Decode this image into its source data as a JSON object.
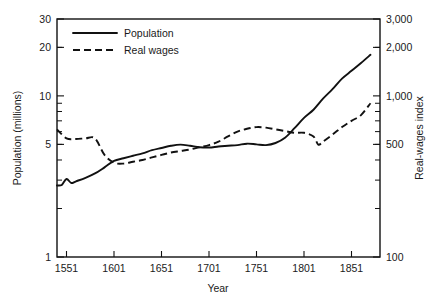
{
  "chart_data": {
    "type": "line",
    "title": "",
    "xlabel": "Year",
    "ylabel": "Population (millions)",
    "y2label": "Real-wages index",
    "xlim": [
      1541,
      1881
    ],
    "xticks": [
      1551,
      1601,
      1651,
      1701,
      1751,
      1801,
      1851
    ],
    "xticklabels": [
      "1551",
      "1601",
      "1651",
      "1701",
      "1751",
      "1801",
      "1851"
    ],
    "yscale": "log",
    "ylim": [
      1,
      30
    ],
    "yticks": [
      1,
      5,
      10,
      20,
      30
    ],
    "yticklabels": [
      "1",
      "5",
      "10",
      "20",
      "30"
    ],
    "y2scale": "log",
    "y2lim": [
      100,
      3000
    ],
    "y2ticks": [
      100,
      500,
      1000,
      2000,
      3000
    ],
    "y2ticklabels": [
      "100",
      "500",
      "1,000",
      "2,000",
      "3,000"
    ],
    "grid": false,
    "legend_position": "upper-left",
    "series": [
      {
        "name": "Population",
        "axis": "left",
        "style": "solid",
        "color": "#111111",
        "x": [
          1541,
          1546,
          1551,
          1556,
          1561,
          1571,
          1581,
          1591,
          1601,
          1611,
          1621,
          1631,
          1641,
          1651,
          1661,
          1671,
          1681,
          1691,
          1701,
          1711,
          1721,
          1731,
          1741,
          1751,
          1761,
          1771,
          1781,
          1791,
          1801,
          1811,
          1821,
          1831,
          1841,
          1851,
          1861,
          1871
        ],
        "values": [
          2.78,
          2.8,
          3.05,
          2.88,
          2.95,
          3.1,
          3.3,
          3.6,
          3.95,
          4.1,
          4.25,
          4.4,
          4.6,
          4.75,
          4.9,
          4.98,
          4.9,
          4.8,
          4.78,
          4.85,
          4.9,
          4.95,
          5.05,
          5.0,
          4.95,
          5.1,
          5.5,
          6.3,
          7.3,
          8.2,
          9.6,
          11.0,
          12.8,
          14.3,
          16.0,
          18.0
        ]
      },
      {
        "name": "Real wages",
        "axis": "right",
        "style": "dashed",
        "color": "#111111",
        "x": [
          1541,
          1551,
          1561,
          1571,
          1581,
          1591,
          1601,
          1611,
          1621,
          1631,
          1641,
          1651,
          1661,
          1671,
          1681,
          1691,
          1701,
          1711,
          1721,
          1731,
          1741,
          1751,
          1761,
          1771,
          1781,
          1791,
          1801,
          1811,
          1816,
          1821,
          1831,
          1841,
          1851,
          1861,
          1871
        ],
        "values": [
          620,
          545,
          540,
          545,
          545,
          430,
          385,
          380,
          390,
          400,
          415,
          430,
          445,
          455,
          465,
          480,
          495,
          520,
          560,
          600,
          625,
          640,
          635,
          620,
          605,
          590,
          590,
          560,
          498,
          520,
          575,
          640,
          700,
          760,
          900
        ]
      }
    ]
  },
  "legend": {
    "items": [
      {
        "label": "Population",
        "style": "solid"
      },
      {
        "label": "Real wages",
        "style": "dashed"
      }
    ]
  },
  "axes": {
    "left_title": "Population (millions)",
    "right_title": "Real-wages index",
    "bottom_title": "Year"
  }
}
